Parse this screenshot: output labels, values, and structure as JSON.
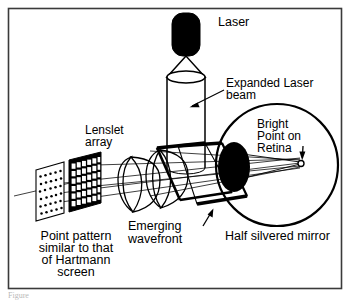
{
  "figure": {
    "kind": "optical-schematic",
    "border_color": "#3a3a3a",
    "background_color": "#ffffff",
    "ink_color": "#000000",
    "caption_fragment": "Figure",
    "labels": {
      "laser": "Laser",
      "expanded_beam_line1": "Expanded Laser",
      "expanded_beam_line2": "beam",
      "lenslet_line1": "Lenslet",
      "lenslet_line2": "array",
      "bright_point_line1": "Bright",
      "bright_point_line2": "Point on",
      "bright_point_line3": "Retina",
      "emerging_line1": "Emerging",
      "emerging_line2": "wavefront",
      "half_mirror": "Half silvered mirror",
      "point_pattern_line1": "Point pattern",
      "point_pattern_line2": "similar to that",
      "point_pattern_line3": "of Hartmann",
      "point_pattern_line4": "screen"
    },
    "components": [
      "laser-source",
      "beam-expander-cone",
      "expanded-beam-cylinder",
      "half-silvered-mirror",
      "emerging-wavefront",
      "lenslet-array",
      "hartmann-point-screen",
      "eye",
      "retina-bright-point"
    ]
  }
}
